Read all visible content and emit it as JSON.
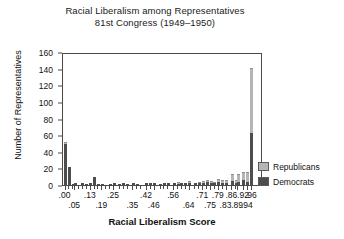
{
  "chart_data": {
    "type": "bar",
    "title": "Racial Liberalism among Representatives",
    "subtitle": "81st Congress (1949–1950)",
    "xlabel": "Racial Liberalism Score",
    "ylabel": "Number of Representatives",
    "ylim": [
      0,
      160
    ],
    "yticks": [
      0,
      20,
      40,
      60,
      80,
      100,
      120,
      140,
      160
    ],
    "xlim": [
      0,
      1
    ],
    "grid": false,
    "legend_position": "right",
    "stacked": true,
    "colors": {
      "Republicans": "#b5b5b5",
      "Democrats": "#4d4d4d"
    },
    "xticks_row0": [
      ".00",
      ".13",
      ".25",
      ".42",
      ".56",
      ".71",
      ".79",
      ".86",
      ".92",
      ".96"
    ],
    "xticks_row1": [
      ".05",
      ".19",
      ".35",
      ".46",
      ".64",
      ".75",
      ".83",
      ".89",
      ".94"
    ],
    "xtick_positions_row0": [
      0.0,
      0.13,
      0.25,
      0.42,
      0.56,
      0.71,
      0.79,
      0.86,
      0.92,
      0.96
    ],
    "xtick_positions_row1": [
      0.05,
      0.19,
      0.35,
      0.46,
      0.64,
      0.75,
      0.83,
      0.89,
      0.94
    ],
    "categories": [
      0.0,
      0.02,
      0.04,
      0.05,
      0.07,
      0.09,
      0.11,
      0.13,
      0.15,
      0.17,
      0.19,
      0.21,
      0.23,
      0.25,
      0.28,
      0.3,
      0.32,
      0.35,
      0.37,
      0.39,
      0.42,
      0.44,
      0.46,
      0.49,
      0.51,
      0.53,
      0.56,
      0.58,
      0.6,
      0.62,
      0.64,
      0.67,
      0.69,
      0.71,
      0.73,
      0.75,
      0.77,
      0.79,
      0.81,
      0.83,
      0.86,
      0.88,
      0.89,
      0.92,
      0.94,
      0.96
    ],
    "series": [
      {
        "name": "Democrats",
        "values": [
          49,
          22,
          1,
          2,
          0,
          2,
          1,
          3,
          10,
          1,
          1,
          0,
          1,
          3,
          1,
          2,
          1,
          2,
          1,
          0,
          2,
          3,
          2,
          1,
          2,
          3,
          2,
          1,
          2,
          2,
          3,
          2,
          2,
          3,
          4,
          3,
          2,
          4,
          3,
          2,
          5,
          3,
          4,
          6,
          4,
          62
        ]
      },
      {
        "name": "Republicans",
        "values": [
          1,
          0,
          0,
          0,
          0,
          0,
          0,
          0,
          0,
          0,
          0,
          0,
          0,
          0,
          0,
          0,
          0,
          0,
          0,
          0,
          0,
          0,
          0,
          0,
          0,
          0,
          0,
          1,
          0,
          0,
          1,
          0,
          1,
          1,
          1,
          1,
          1,
          2,
          2,
          3,
          7,
          2,
          8,
          9,
          10,
          78
        ]
      }
    ],
    "legend": [
      {
        "label": "Republicans",
        "color": "#b5b5b5"
      },
      {
        "label": "Democrats",
        "color": "#4d4d4d"
      }
    ]
  }
}
